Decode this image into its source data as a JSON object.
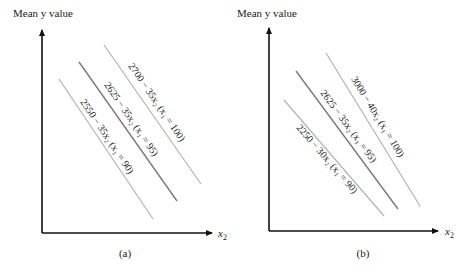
{
  "panels": [
    {
      "id": "a",
      "caption": "(a)",
      "y_axis_label": "Mean y value",
      "x_axis_label_var": "x",
      "x_axis_label_sub": "2",
      "lines": [
        {
          "label": "2700 − 35x₂ (x₁ = 100)",
          "x1_value": 100,
          "intercept": 2700,
          "slope": -35
        },
        {
          "label": "2625 − 35x₂ (x₁ = 95)",
          "x1_value": 95,
          "intercept": 2625,
          "slope": -35
        },
        {
          "label": "2550 − 35x₂ (x₁ = 90)",
          "x1_value": 90,
          "intercept": 2550,
          "slope": -35
        }
      ]
    },
    {
      "id": "b",
      "caption": "(b)",
      "y_axis_label": "Mean y value",
      "x_axis_label_var": "x",
      "x_axis_label_sub": "2",
      "lines": [
        {
          "label": "3000 − 40x₂ (x₁ = 100)",
          "x1_value": 100,
          "intercept": 3000,
          "slope": -40
        },
        {
          "label": "2625 − 35x₂ (x₁ = 95)",
          "x1_value": 95,
          "intercept": 2625,
          "slope": -35
        },
        {
          "label": "2250 − 30x₂ (x₁ = 90)",
          "x1_value": 90,
          "intercept": 2250,
          "slope": -30
        }
      ]
    }
  ]
}
